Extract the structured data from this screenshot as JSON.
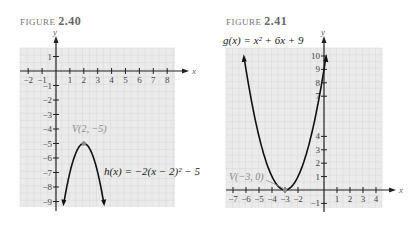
{
  "figures": [
    {
      "label_prefix": "FIGURE",
      "number": "2.40",
      "equation": "h(x) = −2(x − 2)² − 5",
      "vertex_label": "V(2, −5)"
    },
    {
      "label_prefix": "FIGURE",
      "number": "2.41",
      "equation": "g(x) = x² + 6x + 9",
      "vertex_label": "V(−3, 0)"
    }
  ],
  "chart_data": [
    {
      "type": "line",
      "title": "FIGURE 2.40",
      "function": "h(x) = -2(x-2)^2 - 5",
      "xlabel": "x",
      "ylabel": "y",
      "xlim": [
        -2,
        8
      ],
      "ylim": [
        -9,
        1
      ],
      "x_ticks": [
        -2,
        -1,
        1,
        2,
        3,
        4,
        5,
        6,
        7,
        8
      ],
      "y_ticks": [
        1,
        -1,
        -2,
        -3,
        -4,
        -5,
        -6,
        -7,
        -8,
        -9
      ],
      "grid": true,
      "vertex": {
        "x": 2,
        "y": -5,
        "label": "V(2, −5)"
      },
      "x": [
        0.5,
        1,
        1.5,
        2,
        2.5,
        3,
        3.5
      ],
      "y": [
        -9.5,
        -7,
        -5.5,
        -5,
        -5.5,
        -7,
        -9.5
      ]
    },
    {
      "type": "line",
      "title": "FIGURE 2.41",
      "function": "g(x) = x^2 + 6x + 9",
      "xlabel": "x",
      "ylabel": "y",
      "xlim": [
        -7,
        4
      ],
      "ylim": [
        -1,
        10
      ],
      "x_ticks": [
        -7,
        -6,
        -5,
        -4,
        -3,
        -2,
        1,
        2,
        3,
        4
      ],
      "y_ticks": [
        10,
        9,
        8,
        7,
        4,
        3,
        2,
        1,
        -1
      ],
      "grid": true,
      "vertex": {
        "x": -3,
        "y": 0,
        "label": "V(−3, 0)"
      },
      "x": [
        -6.2,
        -5,
        -4,
        -3,
        -2,
        -1,
        0.2
      ],
      "y": [
        10.24,
        4,
        1,
        0,
        1,
        4,
        10.24
      ]
    }
  ],
  "ui": {
    "axis_x": "x",
    "axis_y": "y",
    "grid_bg": "#ebebeb",
    "grid_line": "#d6d6d6",
    "curve": "#111111"
  }
}
